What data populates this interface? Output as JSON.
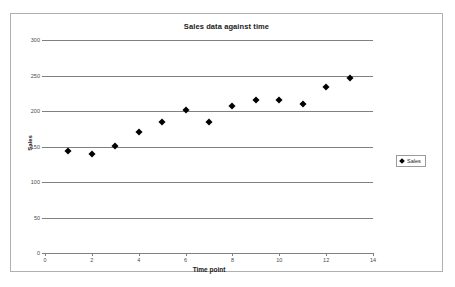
{
  "chart_data": {
    "type": "scatter",
    "title": "Sales data against time",
    "xlabel": "Time point",
    "ylabel": "Sales",
    "xlim": [
      0,
      14
    ],
    "ylim": [
      0,
      300
    ],
    "xticks": [
      0,
      2,
      4,
      6,
      8,
      10,
      12,
      14
    ],
    "yticks": [
      0,
      50,
      100,
      150,
      200,
      250,
      300
    ],
    "grid": "horizontal",
    "legend_position": "right",
    "marker": "diamond",
    "marker_color": "#000000",
    "series": [
      {
        "name": "Sales",
        "x": [
          1,
          2,
          3,
          4,
          5,
          6,
          7,
          8,
          9,
          10,
          11,
          12,
          13
        ],
        "values": [
          143,
          139,
          151,
          170,
          184,
          201,
          184,
          207,
          215,
          216,
          210,
          234,
          246
        ]
      }
    ]
  },
  "legend": {
    "entries": [
      {
        "label": "Sales"
      }
    ]
  }
}
